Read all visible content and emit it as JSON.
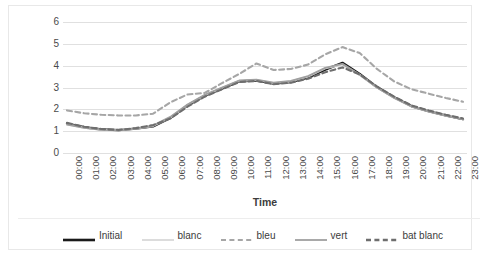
{
  "chart_data": {
    "type": "line",
    "title": "",
    "xlabel": "Time",
    "ylabel": "Latent load (kW)",
    "ylim": [
      0,
      6
    ],
    "yticks": [
      0,
      1,
      2,
      3,
      4,
      5,
      6
    ],
    "grid": true,
    "legend_position": "bottom",
    "x": [
      "00:00",
      "01:00",
      "02:00",
      "03:00",
      "04:00",
      "05:00",
      "06:00",
      "07:00",
      "08:00",
      "09:00",
      "10:00",
      "11:00",
      "12:00",
      "13:00",
      "14:00",
      "15:00",
      "16:00",
      "17:00",
      "18:00",
      "19:00",
      "20:00",
      "21:00",
      "22:00",
      "23:00"
    ],
    "series": [
      {
        "name": "Initial",
        "style": "solid",
        "color": "#1a1a1a",
        "width": 2.3,
        "values": [
          1.35,
          1.18,
          1.08,
          1.05,
          1.12,
          1.22,
          1.6,
          2.18,
          2.62,
          2.95,
          3.28,
          3.32,
          3.18,
          3.25,
          3.45,
          3.82,
          4.13,
          3.62,
          3.02,
          2.55,
          2.15,
          1.92,
          1.72,
          1.55
        ]
      },
      {
        "name": "blanc",
        "style": "solid",
        "color": "#dcdcdc",
        "width": 2.0,
        "values": [
          1.32,
          1.16,
          1.07,
          1.05,
          1.12,
          1.24,
          1.62,
          2.2,
          2.64,
          2.98,
          3.3,
          3.34,
          3.2,
          3.28,
          3.5,
          3.88,
          4.05,
          3.58,
          3.0,
          2.53,
          2.14,
          1.92,
          1.73,
          1.57
        ]
      },
      {
        "name": "bleu",
        "style": "dashed",
        "color": "#a6a6a6",
        "width": 2.1,
        "values": [
          1.95,
          1.82,
          1.75,
          1.72,
          1.72,
          1.8,
          2.32,
          2.68,
          2.75,
          3.2,
          3.62,
          4.1,
          3.8,
          3.85,
          4.05,
          4.52,
          4.85,
          4.58,
          3.85,
          3.28,
          2.92,
          2.72,
          2.52,
          2.35
        ]
      },
      {
        "name": "vert",
        "style": "solid",
        "color": "#a0a0a0",
        "width": 1.9,
        "values": [
          1.3,
          1.15,
          1.06,
          1.04,
          1.12,
          1.25,
          1.65,
          2.22,
          2.66,
          3.0,
          3.32,
          3.36,
          3.22,
          3.3,
          3.52,
          3.9,
          4.08,
          3.58,
          3.0,
          2.52,
          2.13,
          1.9,
          1.7,
          1.54
        ]
      },
      {
        "name": "bat blanc",
        "style": "dashed",
        "color": "#6e6e6e",
        "width": 2.1,
        "values": [
          1.38,
          1.2,
          1.1,
          1.06,
          1.14,
          1.28,
          1.58,
          2.12,
          2.58,
          2.92,
          3.25,
          3.3,
          3.15,
          3.22,
          3.4,
          3.7,
          3.92,
          3.6,
          3.05,
          2.58,
          2.18,
          1.95,
          1.75,
          1.58
        ]
      }
    ]
  },
  "axis": {
    "y_title": "Latent load (kW)",
    "x_title": "Time",
    "y_tick_labels": [
      "6",
      "5",
      "4",
      "3",
      "2",
      "1",
      "0"
    ],
    "x_tick_labels": [
      "00:00",
      "01:00",
      "02:00",
      "03:00",
      "04:00",
      "05:00",
      "06:00",
      "07:00",
      "08:00",
      "09:00",
      "10:00",
      "11:00",
      "12:00",
      "13:00",
      "14:00",
      "15:00",
      "16:00",
      "17:00",
      "18:00",
      "19:00",
      "20:00",
      "21:00",
      "22:00",
      "23:00"
    ]
  },
  "legend": {
    "items": [
      {
        "label": "Initial",
        "color": "#1a1a1a",
        "style": "solid",
        "width": 2.6
      },
      {
        "label": "blanc",
        "color": "#dcdcdc",
        "style": "solid",
        "width": 2.0
      },
      {
        "label": "bleu",
        "color": "#a6a6a6",
        "style": "dashed",
        "width": 2.2
      },
      {
        "label": "vert",
        "color": "#a0a0a0",
        "style": "solid",
        "width": 1.8
      },
      {
        "label": "bat blanc",
        "color": "#6e6e6e",
        "style": "dashed",
        "width": 2.4
      }
    ]
  },
  "colors": {
    "gridline": "#e0e0e0",
    "frame": "#e8e8e8",
    "text": "#3c3c3c",
    "tick_text": "#4a4a4a",
    "background": "#ffffff"
  }
}
